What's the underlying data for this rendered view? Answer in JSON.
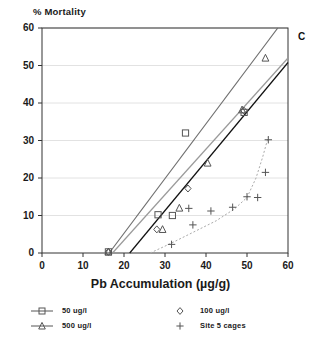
{
  "chart_data": {
    "type": "scatter",
    "title": "",
    "ylabel": "% Mortality",
    "xlabel": "Pb Accumulation (µg/g)",
    "xlim": [
      0,
      60
    ],
    "ylim": [
      0,
      60
    ],
    "xticks": [
      0,
      10,
      20,
      30,
      40,
      50,
      60
    ],
    "yticks": [
      0,
      10,
      20,
      30,
      40,
      50,
      60
    ],
    "xtick_labels": [
      "0",
      "10",
      "20",
      "30",
      "40",
      "50",
      "60"
    ],
    "ytick_labels": [
      "0",
      "10",
      "20",
      "30",
      "40",
      "50",
      "60"
    ],
    "grid": "horizontal",
    "legend_position": "below-axes",
    "panel_label": "C",
    "series": [
      {
        "name": "50 ug/l",
        "marker": "square",
        "points": [
          {
            "x": 16.2,
            "y": 0.3
          },
          {
            "x": 28.3,
            "y": 10.2
          },
          {
            "x": 31.8,
            "y": 10.0
          },
          {
            "x": 35.0,
            "y": 32.0
          },
          {
            "x": 49.3,
            "y": 37.5
          }
        ],
        "trendline": {
          "x0": 21.4,
          "y0": 0,
          "x1": 60.0,
          "y1": 50.8,
          "style": "solid",
          "color": "#111111"
        }
      },
      {
        "name": "100 ug/l",
        "marker": "diamond",
        "points": [
          {
            "x": 16.2,
            "y": 0.3
          },
          {
            "x": 28.0,
            "y": 6.3
          },
          {
            "x": 35.6,
            "y": 17.2
          },
          {
            "x": 49.2,
            "y": 38.0
          }
        ],
        "trendline": {
          "x0": 17.2,
          "y0": 0,
          "x1": 60.0,
          "y1": 52.0,
          "style": "solid",
          "color": "#9a9a9a"
        }
      },
      {
        "name": "500 ug/l",
        "marker": "triangle",
        "points": [
          {
            "x": 16.2,
            "y": 0.3
          },
          {
            "x": 29.4,
            "y": 6.3
          },
          {
            "x": 33.5,
            "y": 12.0
          },
          {
            "x": 40.4,
            "y": 24.0
          },
          {
            "x": 48.8,
            "y": 38.2
          },
          {
            "x": 54.5,
            "y": 52.0
          }
        ],
        "trendline": {
          "x0": 16.4,
          "y0": 0,
          "x1": 57.5,
          "y1": 60.0,
          "style": "solid",
          "color": "#6e6e6e"
        }
      },
      {
        "name": "Site 5 cages",
        "marker": "plus",
        "points": [
          {
            "x": 31.6,
            "y": 2.3
          },
          {
            "x": 36.8,
            "y": 7.5
          },
          {
            "x": 35.8,
            "y": 11.9
          },
          {
            "x": 41.2,
            "y": 11.2
          },
          {
            "x": 46.5,
            "y": 12.2
          },
          {
            "x": 50.0,
            "y": 15.0
          },
          {
            "x": 52.6,
            "y": 14.8
          },
          {
            "x": 54.5,
            "y": 21.5
          },
          {
            "x": 55.2,
            "y": 30.2
          }
        ],
        "trendline": {
          "style": "dotted",
          "color": "#aaaaaa",
          "path": [
            {
              "x": 26.4,
              "y": 0.0
            },
            {
              "x": 31.5,
              "y": 2.6
            },
            {
              "x": 37.0,
              "y": 5.6
            },
            {
              "x": 42.5,
              "y": 8.6
            },
            {
              "x": 47.0,
              "y": 11.8
            },
            {
              "x": 50.0,
              "y": 14.8
            },
            {
              "x": 52.2,
              "y": 20.0
            },
            {
              "x": 53.8,
              "y": 25.5
            },
            {
              "x": 55.2,
              "y": 31.0
            }
          ]
        }
      }
    ]
  },
  "legend": {
    "entries": [
      {
        "label": "50 ug/l",
        "marker": "square",
        "has_line": true
      },
      {
        "label": "100 ug/l",
        "marker": "diamond",
        "has_line": false
      },
      {
        "label": "500 ug/l",
        "marker": "triangle",
        "has_line": true
      },
      {
        "label": "Site 5 cages",
        "marker": "plus",
        "has_line": false
      }
    ]
  },
  "axis_titles": {
    "y": "% Mortality",
    "x": "Pb Accumulation (µg/g)"
  },
  "panel": {
    "label": "C"
  },
  "colors": {
    "axis": "#333333",
    "grid": "#e2e2e2",
    "marker": "#555555",
    "line_dark": "#111111",
    "line_mid": "#6e6e6e",
    "line_light": "#9a9a9a",
    "dotted": "#aaaaaa",
    "text": "#1a1a1a"
  }
}
